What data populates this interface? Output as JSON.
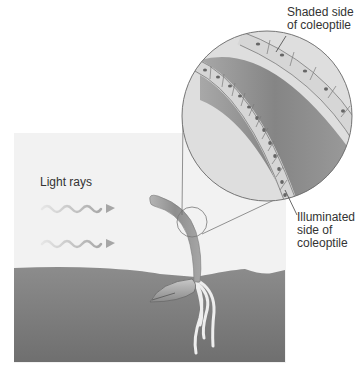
{
  "figure": {
    "labels": {
      "light_rays": "Light rays",
      "shaded": {
        "line1": "Shaded side",
        "line2": "of coleoptile"
      },
      "illuminated": {
        "line1": "Illuminated",
        "line2": "side of",
        "line3": "coleoptile"
      }
    },
    "colors": {
      "background_panel": "#f2f2f2",
      "soil_top": "#8c8c8c",
      "soil_bottom": "#6f6f6f",
      "stem": "#9a9a9a",
      "magnified_outer": "#dcdcdc",
      "magnified_band": "#8e8e8e",
      "cell_fill": "#e4e4e4",
      "nucleus": "#666666",
      "light_ray": "#bdbdbd",
      "root": "#eeeeee",
      "label_text": "#333333"
    }
  }
}
